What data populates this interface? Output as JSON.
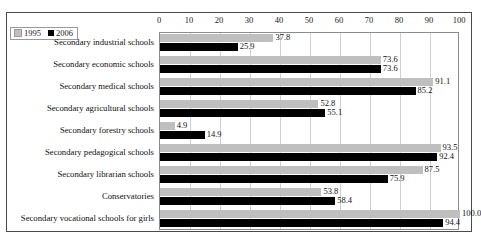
{
  "frame": {
    "ghost_text_above": "·     ·     ·          ·"
  },
  "legend": {
    "items": [
      {
        "label": "1995",
        "color": "#bfbfbf"
      },
      {
        "label": "2006",
        "color": "#000000"
      }
    ]
  },
  "chart_data": {
    "type": "bar",
    "orientation": "horizontal",
    "title": "",
    "subtitle": "",
    "xlabel": "",
    "ylabel": "",
    "xlim": [
      0,
      100
    ],
    "grid": true,
    "legend_position": "top-left",
    "ticks": [
      0,
      10,
      20,
      30,
      40,
      50,
      60,
      70,
      80,
      90,
      100
    ],
    "tick_labels": [
      "0",
      "10",
      "20",
      "30",
      "40",
      "50",
      "60",
      "70",
      "80",
      "90",
      "100"
    ],
    "categories": [
      "Secondary industrial schools",
      "Secondary economic schools",
      "Secondary medical schools",
      "Secondary agricultural schools",
      "Secondary forestry schools",
      "Secondary pedagogical schools",
      "Secondary librarian schools",
      "Conservatories",
      "Secondary vocational schools for girls"
    ],
    "series": [
      {
        "name": "1995",
        "color": "#bfbfbf",
        "values": [
          37.8,
          73.6,
          91.1,
          52.8,
          4.9,
          93.5,
          87.5,
          53.8,
          100.0
        ],
        "value_labels": [
          "37.8",
          "73.6",
          "91.1",
          "52.8",
          "4.9",
          "93.5",
          "87.5",
          "53.8",
          "100.0"
        ]
      },
      {
        "name": "2006",
        "color": "#000000",
        "values": [
          25.9,
          73.6,
          85.2,
          55.1,
          14.9,
          92.4,
          75.9,
          58.4,
          94.4
        ],
        "value_labels": [
          "25.9",
          "73.6",
          "85.2",
          "55.1",
          "14.9",
          "92.4",
          "75.9",
          "58.4",
          "94.4"
        ]
      }
    ]
  }
}
